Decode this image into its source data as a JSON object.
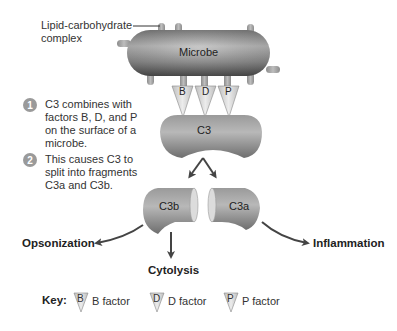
{
  "diagram": {
    "callout": {
      "label_line1": "Lipid-carbohydrate",
      "label_line2": "complex"
    },
    "microbe": {
      "label": "Microbe"
    },
    "factors": [
      {
        "letter": "B"
      },
      {
        "letter": "D"
      },
      {
        "letter": "P"
      }
    ],
    "c3": {
      "label": "C3"
    },
    "fragments": {
      "c3b": "C3b",
      "c3a": "C3a"
    },
    "outcomes": {
      "opsonization": "Opsonization",
      "cytolysis": "Cytolysis",
      "inflammation": "Inflammation"
    },
    "steps": [
      {
        "number": "1",
        "text": "C3 combines with factors B, D, and P on the surface of a microbe."
      },
      {
        "number": "2",
        "text": "This causes C3 to split into fragments C3a and C3b."
      }
    ],
    "key": {
      "title": "Key:",
      "items": [
        {
          "letter": "B",
          "label": "B factor"
        },
        {
          "letter": "D",
          "label": "D factor"
        },
        {
          "letter": "P",
          "label": "P factor"
        }
      ]
    },
    "colors": {
      "microbe_dark": "#5a5a5a",
      "microbe_light": "#b8b8b8",
      "stalk": "#9c9c9c",
      "factor_fill": "#d8d8d8",
      "arrow": "#444444"
    }
  }
}
